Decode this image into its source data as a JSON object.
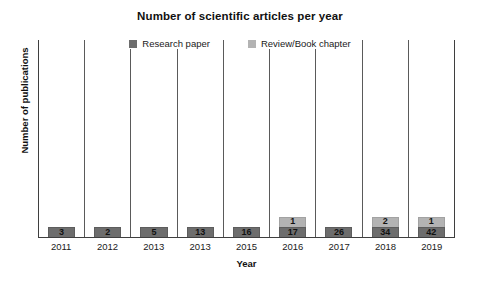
{
  "chart_data": {
    "type": "bar",
    "subtype": "stacked-column",
    "title": "Number of scientific articles per year",
    "xlabel": "Year",
    "ylabel": "Number of publications",
    "categories": [
      "2011",
      "2012",
      "2013",
      "2013",
      "2015",
      "2016",
      "2017",
      "2018",
      "2019"
    ],
    "series": [
      {
        "name": "Research paper",
        "color": "#6d6d6d",
        "values": [
          3,
          2,
          5,
          13,
          16,
          17,
          26,
          34,
          42
        ]
      },
      {
        "name": "Review/Book chapter",
        "color": "#b3b3b3",
        "values": [
          0,
          0,
          0,
          0,
          0,
          1,
          0,
          2,
          1
        ]
      }
    ],
    "totals": [
      3,
      2,
      5,
      13,
      16,
      18,
      26,
      36,
      43
    ],
    "ylim": [
      0,
      45
    ],
    "grid": false,
    "y_axis_ticks_visible": false,
    "legend_position": "top-center",
    "axis_line_color": "#3f3f3f",
    "category_separator_color": "#5a5a5a",
    "background_color": "#ffffff"
  },
  "legend": {
    "items": [
      {
        "label": "Research paper",
        "swatch": "legend-swatch-research"
      },
      {
        "label": "Review/Book chapter",
        "swatch": "legend-swatch-review"
      }
    ]
  }
}
